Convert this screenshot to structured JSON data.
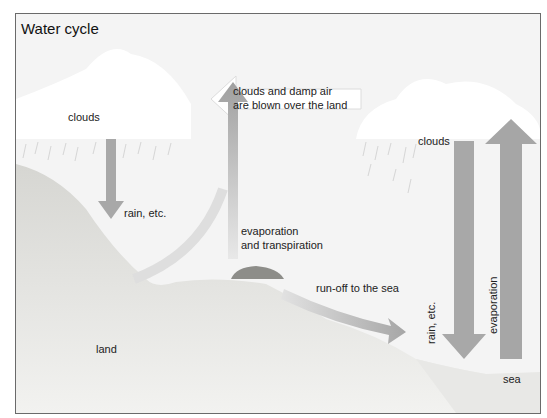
{
  "diagram": {
    "title": "Water cycle",
    "labels": {
      "clouds_left": "clouds",
      "clouds_right": "clouds",
      "wind_line1": "clouds and damp air",
      "wind_line2": "are blown over the land",
      "rain_left": "rain, etc.",
      "evap_line1": "evaporation",
      "evap_line2": "and transpiration",
      "runoff": "run-off to the sea",
      "rain_right": "rain, etc.",
      "evap_right": "evaporation",
      "land": "land",
      "sea": "sea"
    },
    "colors": {
      "frame_border": "#6a6a6a",
      "background": "#f4f4f4",
      "cloud": "#ffffff",
      "land": "#dcdcd8",
      "arrow": "#a8a8a8",
      "vegetation": "#8a8a86",
      "sea": "#e6e6e4"
    }
  }
}
